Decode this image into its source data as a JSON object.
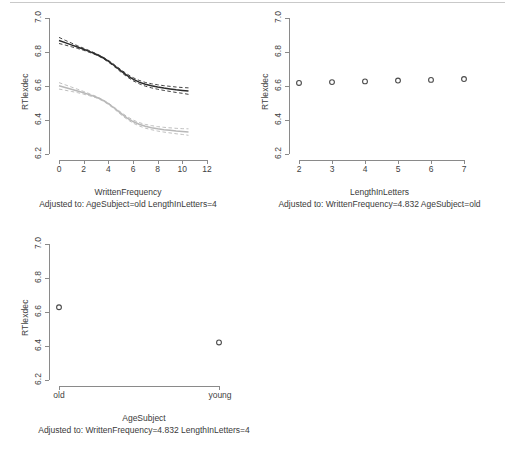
{
  "figure": {
    "title": "",
    "ylabel": "RTlexdec",
    "panels": [
      "WrittenFrequency",
      "LengthInLetters",
      "AgeSubject"
    ]
  },
  "panel_wf": {
    "ylabel": "RTlexdec",
    "xlabel": "WrittenFrequency",
    "adjusted": "Adjusted to: AgeSubject=old LengthInLetters=4",
    "yticks": [
      "6.2",
      "6.4",
      "6.6",
      "6.8",
      "7.0"
    ],
    "xticks": [
      "0",
      "2",
      "4",
      "6",
      "8",
      "10",
      "12"
    ]
  },
  "panel_lil": {
    "ylabel": "RTlexdec",
    "xlabel": "LengthInLetters",
    "adjusted": "Adjusted to: WrittenFrequency=4.832 AgeSubject=old",
    "yticks": [
      "6.2",
      "6.4",
      "6.6",
      "6.8",
      "7.0"
    ],
    "xticks": [
      "2",
      "3",
      "4",
      "5",
      "6",
      "7"
    ]
  },
  "panel_age": {
    "ylabel": "RTlexdec",
    "xlabel": "AgeSubject",
    "adjusted": "Adjusted to: WrittenFrequency=4.832 LengthInLetters=4",
    "yticks": [
      "6.2",
      "6.4",
      "6.6",
      "6.8",
      "7.0"
    ],
    "xticks": [
      "old",
      "young"
    ]
  },
  "colors": {
    "dark_curve": "#2b2b2b",
    "gray_curve": "#b8b8b8",
    "axis": "#8a8a8a",
    "point": "#4a4a4a",
    "background": "#ffffff"
  },
  "chart_data": [
    {
      "type": "line",
      "title": "WrittenFrequency",
      "xlabel": "WrittenFrequency",
      "ylabel": "RTlexdec",
      "annotation": "Adjusted to: AgeSubject=old LengthInLetters=4",
      "xlim": [
        0,
        12
      ],
      "ylim": [
        6.2,
        7.0
      ],
      "xticks": [
        0,
        2,
        4,
        6,
        8,
        10,
        12
      ],
      "yticks": [
        6.2,
        6.4,
        6.6,
        6.8,
        7.0
      ],
      "grid": false,
      "legend": "none",
      "x": [
        0,
        0.5,
        1,
        1.5,
        2,
        2.5,
        3,
        3.5,
        4,
        4.5,
        5,
        5.5,
        6,
        6.5,
        7,
        7.5,
        8,
        8.5,
        9,
        9.5,
        10,
        10.5
      ],
      "series": [
        {
          "name": "upper-dark-curve",
          "color": "#2b2b2b",
          "values": [
            6.868,
            6.855,
            6.842,
            6.829,
            6.816,
            6.802,
            6.787,
            6.769,
            6.746,
            6.719,
            6.69,
            6.663,
            6.64,
            6.623,
            6.61,
            6.601,
            6.594,
            6.588,
            6.583,
            6.578,
            6.574,
            6.57
          ],
          "ci_upper": [
            6.886,
            6.869,
            6.853,
            6.837,
            6.822,
            6.807,
            6.791,
            6.773,
            6.751,
            6.725,
            6.697,
            6.671,
            6.649,
            6.633,
            6.621,
            6.613,
            6.607,
            6.602,
            6.598,
            6.594,
            6.591,
            6.589
          ],
          "ci_lower": [
            6.85,
            6.841,
            6.831,
            6.821,
            6.81,
            6.797,
            6.783,
            6.765,
            6.741,
            6.713,
            6.683,
            6.655,
            6.631,
            6.613,
            6.599,
            6.589,
            6.581,
            6.574,
            6.568,
            6.562,
            6.557,
            6.551
          ]
        },
        {
          "name": "lower-gray-curve",
          "color": "#b8b8b8",
          "values": [
            6.601,
            6.591,
            6.581,
            6.571,
            6.56,
            6.548,
            6.535,
            6.518,
            6.496,
            6.469,
            6.44,
            6.413,
            6.391,
            6.375,
            6.363,
            6.355,
            6.348,
            6.343,
            6.339,
            6.335,
            6.332,
            6.329
          ],
          "ci_upper": [
            6.62,
            6.607,
            6.594,
            6.581,
            6.568,
            6.554,
            6.539,
            6.522,
            6.5,
            6.474,
            6.447,
            6.421,
            6.4,
            6.385,
            6.374,
            6.367,
            6.361,
            6.357,
            6.354,
            6.351,
            6.349,
            6.348
          ],
          "ci_lower": [
            6.582,
            6.575,
            6.568,
            6.561,
            6.552,
            6.542,
            6.531,
            6.514,
            6.492,
            6.464,
            6.433,
            6.405,
            6.382,
            6.365,
            6.352,
            6.343,
            6.335,
            6.329,
            6.324,
            6.319,
            6.315,
            6.31
          ]
        }
      ]
    },
    {
      "type": "scatter",
      "title": "LengthInLetters",
      "xlabel": "LengthInLetters",
      "ylabel": "RTlexdec",
      "annotation": "Adjusted to: WrittenFrequency=4.832 AgeSubject=old",
      "xlim": [
        2,
        7
      ],
      "ylim": [
        6.2,
        7.0
      ],
      "xticks": [
        2,
        3,
        4,
        5,
        6,
        7
      ],
      "yticks": [
        6.2,
        6.4,
        6.6,
        6.8,
        7.0
      ],
      "grid": false,
      "legend": "none",
      "x": [
        2,
        3,
        4,
        5,
        6,
        7
      ],
      "values": [
        6.618,
        6.623,
        6.627,
        6.632,
        6.636,
        6.641
      ]
    },
    {
      "type": "scatter",
      "title": "AgeSubject",
      "xlabel": "AgeSubject",
      "ylabel": "RTlexdec",
      "annotation": "Adjusted to: WrittenFrequency=4.832 LengthInLetters=4",
      "categories": [
        "old",
        "young"
      ],
      "ylim": [
        6.2,
        7.0
      ],
      "yticks": [
        6.2,
        6.4,
        6.6,
        6.8,
        7.0
      ],
      "grid": false,
      "legend": "none",
      "values": [
        6.628,
        6.421
      ]
    }
  ]
}
